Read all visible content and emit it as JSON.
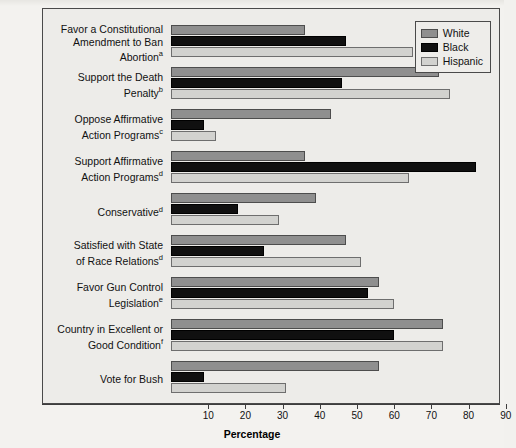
{
  "chart_data": {
    "type": "bar",
    "orientation": "horizontal",
    "title": "",
    "xlabel": "Percentage",
    "ylabel": "",
    "xlim": [
      0,
      100
    ],
    "xticks": [
      10,
      20,
      30,
      40,
      50,
      60,
      70,
      80,
      90
    ],
    "grid": false,
    "legend_position": "top-right",
    "categories": [
      "Favor a Constitutional Amendment to Ban Abortion",
      "Support the Death Penalty",
      "Oppose Affirmative Action Programs",
      "Support Affirmative Action Programs",
      "Conservative",
      "Satisfied with State of Race Relations",
      "Favor Gun Control Legislation",
      "Country in Excellent or Good Condition",
      "Vote for Bush"
    ],
    "category_footnotes": [
      "a",
      "b",
      "c",
      "d",
      "d",
      "d",
      "e",
      "f",
      ""
    ],
    "series": [
      {
        "name": "White",
        "color": "#8f8f8f",
        "values": [
          36,
          72,
          43,
          36,
          39,
          47,
          56,
          73,
          56
        ]
      },
      {
        "name": "Black",
        "color": "#101010",
        "values": [
          47,
          46,
          9,
          82,
          18,
          25,
          53,
          60,
          9
        ]
      },
      {
        "name": "Hispanic",
        "color": "#d2d2cf",
        "values": [
          65,
          75,
          12,
          64,
          29,
          51,
          60,
          73,
          31
        ]
      }
    ]
  },
  "axis": {
    "title": "Percentage",
    "tick_labels": [
      "10",
      "20",
      "30",
      "40",
      "50",
      "60",
      "70",
      "80",
      "90"
    ]
  },
  "legend": {
    "items": [
      {
        "label": "White",
        "swatch": "white-swatch"
      },
      {
        "label": "Black",
        "swatch": "black-swatch"
      },
      {
        "label": "Hispanic",
        "swatch": "hispanic-swatch"
      }
    ]
  },
  "categories": [
    {
      "line1": "Favor a Constitutional",
      "line2": "Amendment to Ban",
      "line3": "Abortion",
      "sup": "a"
    },
    {
      "line1": "Support the Death",
      "line2": "Penalty",
      "line3": "",
      "sup": "b"
    },
    {
      "line1": "Oppose Affirmative",
      "line2": "Action Programs",
      "line3": "",
      "sup": "c"
    },
    {
      "line1": "Support Affirmative",
      "line2": "Action Programs",
      "line3": "",
      "sup": "d"
    },
    {
      "line1": "Conservative",
      "line2": "",
      "line3": "",
      "sup": "d"
    },
    {
      "line1": "Satisfied with State",
      "line2": "of Race Relations",
      "line3": "",
      "sup": "d"
    },
    {
      "line1": "Favor Gun Control",
      "line2": "Legislation",
      "line3": "",
      "sup": "e"
    },
    {
      "line1": "Country in Excellent or",
      "line2": "Good Condition",
      "line3": "",
      "sup": "f"
    },
    {
      "line1": "Vote for Bush",
      "line2": "",
      "line3": "",
      "sup": ""
    }
  ]
}
